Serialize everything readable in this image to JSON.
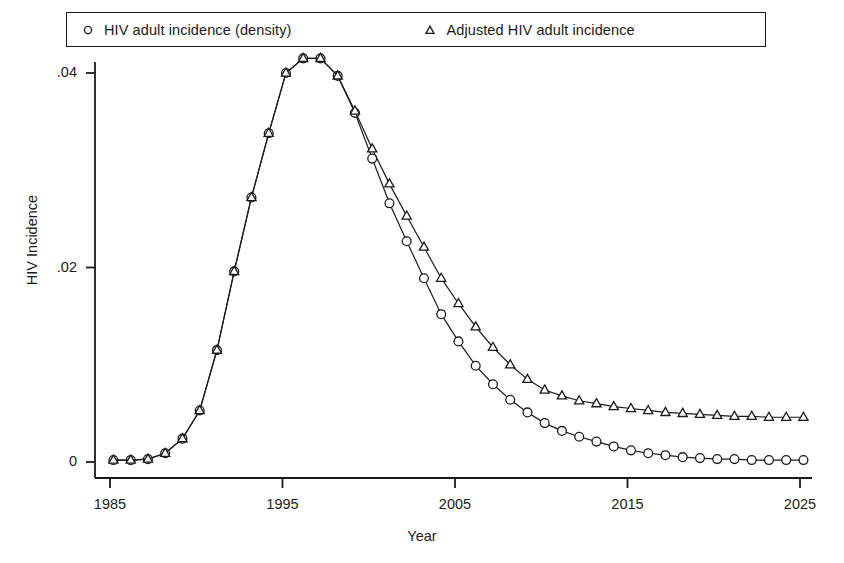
{
  "chart_data": {
    "type": "line",
    "title": "",
    "xlabel": "Year",
    "ylabel": "HIV Incidence",
    "xlim": [
      1984.3,
      2025.6
    ],
    "ylim": [
      -0.0013,
      0.0437
    ],
    "xticks": [
      1985,
      1995,
      2005,
      2015,
      2025
    ],
    "xticklabels": [
      "1985",
      "1995",
      "2005",
      "2015",
      "2025"
    ],
    "yticks": [
      0,
      0.02,
      0.04
    ],
    "yticklabels": [
      "0",
      ".02",
      ".04"
    ],
    "grid": false,
    "legend_position": "top-outside",
    "x": [
      1985.2,
      1986.2,
      1987.2,
      1988.2,
      1989.2,
      1990.2,
      1991.2,
      1992.2,
      1993.2,
      1994.2,
      1995.2,
      1996.2,
      1997.2,
      1998.2,
      1999.2,
      2000.2,
      2001.2,
      2002.2,
      2003.2,
      2004.2,
      2005.2,
      2006.2,
      2007.2,
      2008.2,
      2009.2,
      2010.2,
      2011.2,
      2012.2,
      2013.2,
      2014.2,
      2015.2,
      2016.2,
      2017.2,
      2018.2,
      2019.2,
      2020.2,
      2021.2,
      2022.2,
      2023.2,
      2024.2,
      2025.2
    ],
    "series": [
      {
        "name": "HIV adult incidence (density)",
        "marker": "circle",
        "values": [
          0.0002,
          0.0002,
          0.0003,
          0.0009,
          0.0024,
          0.0053,
          0.0115,
          0.0196,
          0.0272,
          0.0338,
          0.04,
          0.0415,
          0.0415,
          0.0397,
          0.0359,
          0.0312,
          0.0266,
          0.0227,
          0.0189,
          0.0152,
          0.0124,
          0.0099,
          0.008,
          0.0064,
          0.0051,
          0.004,
          0.0032,
          0.0026,
          0.0021,
          0.0016,
          0.0012,
          0.0009,
          0.0007,
          0.0005,
          0.0004,
          0.0003,
          0.0003,
          0.0002,
          0.0002,
          0.0002,
          0.0002
        ]
      },
      {
        "name": "Adjusted HIV adult incidence",
        "marker": "triangle",
        "values": [
          0.0002,
          0.0002,
          0.0003,
          0.0009,
          0.0024,
          0.0053,
          0.0115,
          0.0196,
          0.0272,
          0.0338,
          0.04,
          0.0415,
          0.0415,
          0.0397,
          0.0361,
          0.0322,
          0.0286,
          0.0253,
          0.0221,
          0.0189,
          0.0163,
          0.0139,
          0.0118,
          0.01,
          0.0085,
          0.0074,
          0.0068,
          0.0063,
          0.006,
          0.0057,
          0.0055,
          0.0053,
          0.0051,
          0.005,
          0.0049,
          0.0048,
          0.0047,
          0.0047,
          0.0046,
          0.0046,
          0.0046
        ]
      }
    ]
  },
  "legend": {
    "entries": [
      {
        "marker": "circle-marker",
        "label": "HIV adult incidence (density)"
      },
      {
        "marker": "triangle-marker",
        "label": "Adjusted HIV adult incidence"
      }
    ]
  },
  "colors": {
    "ink": "#1a1a1a",
    "background": "#ffffff"
  }
}
